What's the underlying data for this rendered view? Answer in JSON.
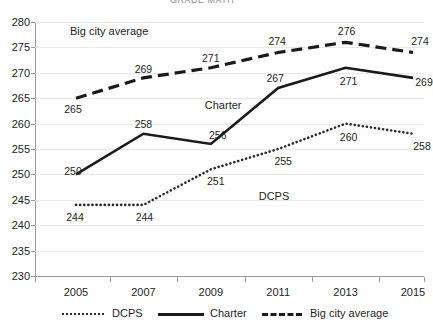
{
  "partial_title": "GRADE  MATH",
  "chart_data": {
    "type": "line",
    "title": "",
    "xlabel": "",
    "ylabel": "",
    "categories": [
      "2005",
      "2007",
      "2009",
      "2011",
      "2013",
      "2015"
    ],
    "ylim": [
      230,
      280
    ],
    "yticks": [
      230,
      235,
      240,
      245,
      250,
      255,
      260,
      265,
      270,
      275,
      280
    ],
    "grid": true,
    "legend_position": "bottom",
    "series": [
      {
        "name": "DCPS",
        "style": "dotted",
        "color": "#2b2b2b",
        "values": [
          244,
          244,
          251,
          255,
          260,
          258
        ]
      },
      {
        "name": "Charter",
        "style": "solid",
        "color": "#1a1a1a",
        "values": [
          250,
          258,
          256,
          267,
          271,
          269
        ]
      },
      {
        "name": "Big city average",
        "style": "dashed",
        "color": "#1a1a1a",
        "values": [
          265,
          269,
          271,
          274,
          276,
          274
        ]
      }
    ],
    "inplot_annotations": [
      {
        "text": "Big city average",
        "x": 2005,
        "y": 278
      },
      {
        "text": "Charter",
        "x": 2009,
        "y": 263.5
      },
      {
        "text": "DCPS",
        "x": 2010.6,
        "y": 245.6
      }
    ]
  },
  "legend": {
    "items": [
      {
        "label": "DCPS",
        "style": "dotted"
      },
      {
        "label": "Charter",
        "style": "solid"
      },
      {
        "label": "Big city average",
        "style": "dashed"
      }
    ]
  },
  "axis": {
    "y_labels": [
      "280",
      "275",
      "270",
      "265",
      "260",
      "255",
      "250",
      "245",
      "240",
      "235",
      "230"
    ],
    "x_labels": [
      "2005",
      "2007",
      "2009",
      "2011",
      "2013",
      "2015"
    ]
  },
  "data_labels": {
    "dcps": [
      "244",
      "244",
      "251",
      "255",
      "260",
      "258"
    ],
    "charter": [
      "250",
      "258",
      "256",
      "267",
      "271",
      "269"
    ],
    "big_city_average": [
      "265",
      "269",
      "271",
      "274",
      "276",
      "274"
    ]
  }
}
